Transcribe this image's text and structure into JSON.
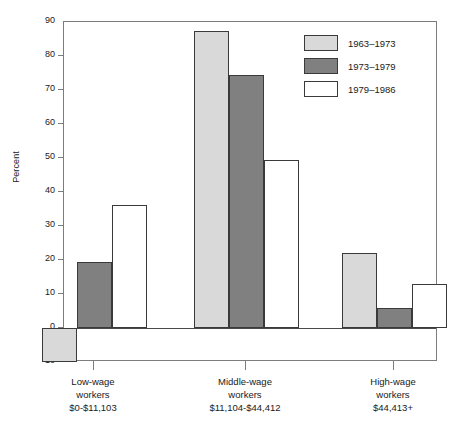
{
  "chart_data": {
    "type": "bar",
    "title": "",
    "subtitle": "",
    "xlabel": "",
    "ylabel": "Percent",
    "ylim": [
      -10,
      90
    ],
    "yticks": [
      -10,
      0,
      10,
      20,
      30,
      40,
      50,
      60,
      70,
      80,
      90
    ],
    "ytick_labels": [
      "-10",
      "0",
      "10",
      "20",
      "30",
      "40",
      "50",
      "60",
      "70",
      "80",
      "90"
    ],
    "grid": false,
    "legend_position": "top-right",
    "categories": [
      "Low-wage\nworkers\n$0-$11,103",
      "Middle-wage\nworkers\n$11,104-$44,412",
      "High-wage\nworkers\n$44,413+"
    ],
    "category_lines": [
      [
        "Low-wage",
        "workers",
        "$0-$11,103"
      ],
      [
        "Middle-wage",
        "workers",
        "$11,104-$44,412"
      ],
      [
        "High-wage",
        "workers",
        "$44,413+"
      ]
    ],
    "series": [
      {
        "name": "1963–1973",
        "color": "#d9d9d9",
        "values": [
          -10,
          87.5,
          22
        ]
      },
      {
        "name": "1973–1979",
        "color": "#808080",
        "values": [
          19.5,
          74.5,
          6
        ]
      },
      {
        "name": "1979–1986",
        "color": "#ffffff",
        "values": [
          36.3,
          49.5,
          13
        ]
      }
    ]
  },
  "legend": {
    "items": [
      {
        "label": "1963–1973",
        "color": "#d9d9d9"
      },
      {
        "label": "1973–1979",
        "color": "#808080"
      },
      {
        "label": "1979–1986",
        "color": "#ffffff"
      }
    ]
  },
  "colors": {
    "series_light": "#d9d9d9",
    "series_dark": "#808080",
    "series_white": "#ffffff",
    "bar_outline": "#3a3a3a",
    "axis": "#7d7d7d",
    "zero_line": "#4a4a4a",
    "text": "#1a1a1a",
    "background": "#ffffff"
  }
}
